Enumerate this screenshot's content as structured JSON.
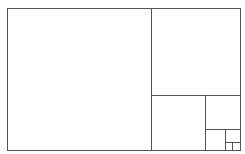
{
  "diagram": {
    "type": "golden-rectangle-subdivision",
    "stroke_color": "#555555",
    "top_fragment": "· ··",
    "outer": {
      "x": 7,
      "y": 8,
      "w": 233,
      "h": 142
    },
    "lines": [
      {
        "name": "divider-1-vertical",
        "x1": 151,
        "y1": 8,
        "x2": 151,
        "y2": 150
      },
      {
        "name": "divider-2-horizontal",
        "x1": 151,
        "y1": 95,
        "x2": 240,
        "y2": 95
      },
      {
        "name": "divider-3-vertical",
        "x1": 205,
        "y1": 95,
        "x2": 205,
        "y2": 150
      },
      {
        "name": "divider-4-horizontal",
        "x1": 205,
        "y1": 129,
        "x2": 240,
        "y2": 129
      },
      {
        "name": "divider-5-vertical",
        "x1": 225,
        "y1": 129,
        "x2": 225,
        "y2": 150
      },
      {
        "name": "divider-6-horizontal",
        "x1": 225,
        "y1": 142,
        "x2": 240,
        "y2": 142
      },
      {
        "name": "divider-7-vertical",
        "x1": 232,
        "y1": 142,
        "x2": 232,
        "y2": 150
      }
    ]
  }
}
